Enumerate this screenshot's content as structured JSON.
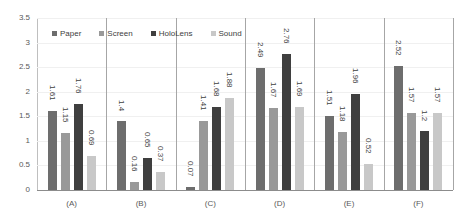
{
  "chart_data": {
    "type": "bar",
    "title": "",
    "xlabel": "",
    "ylabel": "",
    "ylim": [
      0,
      3.5
    ],
    "yticks": [
      "0",
      "0.5",
      "1",
      "1.5",
      "2",
      "2.5",
      "3",
      "3.5"
    ],
    "grid": true,
    "legend_position": "top-inside",
    "categories": [
      "(A)",
      "(B)",
      "(C)",
      "(D)",
      "(E)",
      "(F)"
    ],
    "series": [
      {
        "name": "Paper",
        "color": "#6d6d6d",
        "values": [
          1.61,
          1.4,
          0.07,
          2.49,
          1.51,
          2.52
        ]
      },
      {
        "name": "Screen",
        "color": "#999999",
        "values": [
          1.15,
          0.16,
          1.41,
          1.67,
          1.18,
          1.57
        ]
      },
      {
        "name": "HoloLens",
        "color": "#3f3f3f",
        "values": [
          1.76,
          0.65,
          1.68,
          2.76,
          1.96,
          1.2
        ]
      },
      {
        "name": "Sound",
        "color": "#c8c8c8",
        "values": [
          0.69,
          0.37,
          1.88,
          1.69,
          0.52,
          1.57
        ]
      }
    ]
  }
}
